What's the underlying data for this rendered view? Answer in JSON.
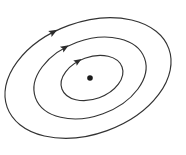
{
  "figure": {
    "kind": "phase-portrait",
    "background_color": "#ffffff",
    "stroke_color": "#333333",
    "arrow_color": "#2b2b2b",
    "dot_color": "#1a1a1a",
    "width": 186,
    "height": 155
  },
  "chart_data": {
    "type": "line",
    "title": "",
    "subtitle": "",
    "xlabel": "",
    "ylabel": "",
    "grid": false,
    "legend": null,
    "axes_visible": false,
    "tick_labels": [],
    "annotations": [],
    "center": {
      "x": 90,
      "y": 78
    },
    "rotation_deg": -20,
    "series": [
      {
        "name": "inner-orbit",
        "type": "closed-ellipse",
        "cx": 92,
        "cy": 78,
        "rx": 32,
        "ry": 21,
        "rotation_deg": -20,
        "direction": "clockwise",
        "arrow_angle_deg": 250
      },
      {
        "name": "middle-orbit",
        "type": "closed-ellipse",
        "cx": 90,
        "cy": 78,
        "rx": 58,
        "ry": 38,
        "rotation_deg": -20,
        "direction": "clockwise",
        "arrow_angle_deg": 253
      },
      {
        "name": "outer-orbit",
        "type": "closed-ellipse",
        "cx": 88,
        "cy": 78,
        "rx": 86,
        "ry": 56,
        "rotation_deg": -20,
        "direction": "clockwise",
        "arrow_angle_deg": 256
      }
    ],
    "points": [
      {
        "name": "equilibrium-point",
        "x": 90,
        "y": 78,
        "radius": 2.8,
        "filled": true
      }
    ]
  }
}
